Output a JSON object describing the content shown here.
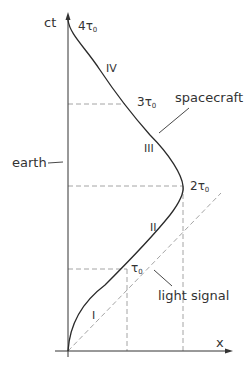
{
  "diagram": {
    "type": "spacetime-diagram",
    "axes": {
      "vertical": "ct",
      "horizontal": "x"
    },
    "labels": {
      "earth": "earth",
      "spacecraft": "spacecraft",
      "light_signal": "light signal"
    },
    "segments": [
      "I",
      "II",
      "III",
      "IV"
    ],
    "times": {
      "t1": "τ",
      "t1_sub": "0",
      "t1_coef": "",
      "t2": "2τ",
      "t2_sub": "0",
      "t3": "3τ",
      "t3_sub": "0",
      "t4": "4τ",
      "t4_sub": "0"
    },
    "colors": {
      "line": "#333333",
      "dashed": "#999999"
    }
  }
}
